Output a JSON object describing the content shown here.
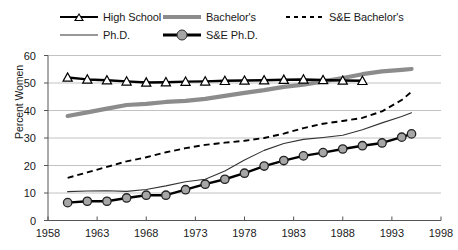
{
  "chart_data": {
    "type": "line",
    "title": "",
    "xlabel": "",
    "ylabel": "Percent Women",
    "xlim": [
      1958,
      1998
    ],
    "ylim": [
      0,
      60
    ],
    "xticks": [
      1958,
      1963,
      1968,
      1973,
      1978,
      1983,
      1988,
      1993,
      1998
    ],
    "yticks": [
      0,
      10,
      20,
      30,
      40,
      50,
      60
    ],
    "grid": "horizontal",
    "legend_position": "top",
    "series": [
      {
        "name": "High School",
        "style": "solid-thick-marker",
        "color": "#000000",
        "marker": "triangle-open",
        "x": [
          1960,
          1962,
          1964,
          1966,
          1968,
          1970,
          1972,
          1974,
          1976,
          1978,
          1980,
          1982,
          1984,
          1986,
          1988,
          1990
        ],
        "values": [
          52.0,
          51.3,
          51.0,
          50.6,
          50.2,
          50.3,
          50.5,
          50.6,
          50.8,
          50.9,
          51.0,
          51.2,
          51.3,
          51.1,
          50.9,
          50.8
        ]
      },
      {
        "name": "Bachelor's",
        "style": "solid-heavy",
        "color": "#8c8c8c",
        "marker": "none",
        "x": [
          1960,
          1962,
          1964,
          1966,
          1968,
          1970,
          1972,
          1974,
          1976,
          1978,
          1980,
          1982,
          1984,
          1986,
          1988,
          1990,
          1992,
          1994,
          1995
        ],
        "values": [
          38.0,
          39.3,
          40.7,
          42.0,
          42.4,
          43.1,
          43.5,
          44.2,
          45.3,
          46.4,
          47.4,
          48.6,
          49.4,
          50.6,
          51.8,
          53.2,
          54.2,
          54.8,
          55.1
        ]
      },
      {
        "name": "S&E Bachelor's",
        "style": "dashed",
        "color": "#000000",
        "marker": "none",
        "x": [
          1960,
          1962,
          1964,
          1966,
          1968,
          1970,
          1972,
          1974,
          1976,
          1978,
          1980,
          1982,
          1984,
          1986,
          1988,
          1990,
          1992,
          1994,
          1995
        ],
        "values": [
          15.5,
          17.5,
          19.5,
          21.5,
          23.0,
          24.8,
          26.3,
          27.5,
          28.3,
          29.0,
          30.0,
          31.6,
          33.6,
          35.2,
          36.2,
          37.3,
          39.7,
          43.8,
          46.8
        ]
      },
      {
        "name": "Ph.D.",
        "style": "solid-thin",
        "color": "#333333",
        "marker": "none",
        "x": [
          1960,
          1962,
          1964,
          1966,
          1968,
          1970,
          1972,
          1974,
          1976,
          1978,
          1980,
          1982,
          1984,
          1986,
          1988,
          1990,
          1992,
          1994,
          1995
        ],
        "values": [
          10.5,
          10.7,
          10.8,
          10.6,
          11.3,
          12.6,
          14.1,
          15.0,
          18.0,
          22.0,
          25.5,
          28.0,
          29.5,
          30.2,
          31.0,
          33.0,
          35.5,
          37.8,
          39.2
        ]
      },
      {
        "name": "S&E Ph.D.",
        "style": "solid-thick-marker",
        "color": "#000000",
        "marker": "circle-filled",
        "x": [
          1960,
          1962,
          1964,
          1966,
          1968,
          1970,
          1972,
          1974,
          1976,
          1978,
          1980,
          1982,
          1984,
          1986,
          1988,
          1990,
          1992,
          1994,
          1995
        ],
        "values": [
          6.5,
          7.0,
          7.0,
          8.2,
          9.2,
          9.2,
          11.2,
          13.2,
          15.0,
          17.2,
          19.8,
          21.8,
          23.5,
          24.7,
          26.0,
          27.2,
          28.2,
          30.3,
          31.5
        ]
      }
    ]
  },
  "legend": {
    "entries": [
      {
        "label": "High School",
        "key": "hs"
      },
      {
        "label": "Bachelor's",
        "key": "bach"
      },
      {
        "label": "S&E Bachelor's",
        "key": "sebach"
      },
      {
        "label": "Ph.D.",
        "key": "phd"
      },
      {
        "label": "S&E Ph.D.",
        "key": "sephd"
      }
    ]
  }
}
